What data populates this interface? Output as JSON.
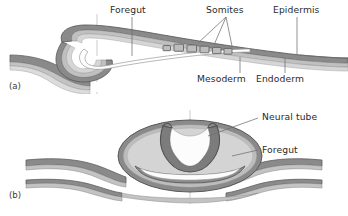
{
  "figure": {
    "panels": [
      {
        "id": "a",
        "id_label": "(a)",
        "view": "sagittal section",
        "labels": [
          {
            "key": "foregut",
            "text": "Foregut",
            "position": "top",
            "x": 110,
            "y": 6,
            "leader_from": [
              132,
              17
            ],
            "leader_to": [
              132,
              55
            ]
          },
          {
            "key": "somites",
            "text": "Somites",
            "position": "top",
            "x": 206,
            "y": 6,
            "leader_from": [
              225,
              17
            ],
            "leader_to": [
              196,
              43
            ]
          },
          {
            "key": "epidermis",
            "text": "Epidermis",
            "position": "top",
            "x": 275,
            "y": 6,
            "leader_from": [
              296,
              17
            ],
            "leader_to": [
              280,
              49
            ]
          },
          {
            "key": "mesoderm",
            "text": "Mesoderm",
            "position": "bottom",
            "x": 198,
            "y": 76,
            "leader_from": [
              240,
              74
            ],
            "leader_to": [
              240,
              56
            ]
          },
          {
            "key": "endoderm",
            "text": "Endoderm",
            "position": "bottom",
            "x": 262,
            "y": 76,
            "leader_from": [
              283,
              74
            ],
            "leader_to": [
              283,
              55
            ]
          }
        ],
        "somite_count": 6
      },
      {
        "id": "b",
        "id_label": "(b)",
        "view": "transverse section",
        "labels": [
          {
            "key": "neural-tube",
            "text": "Neural tube",
            "position": "right",
            "x": 262,
            "y": 113,
            "leader_from": [
              258,
              119
            ],
            "leader_to": [
              206,
              136
            ]
          },
          {
            "key": "foregut",
            "text": "Foregut",
            "position": "right",
            "x": 262,
            "y": 146,
            "leader_from": [
              258,
              151
            ],
            "leader_to": [
              222,
              157
            ]
          }
        ]
      }
    ],
    "guides": [
      {
        "key": "guide-a",
        "x": 97,
        "y1": 14,
        "y2": 94
      },
      {
        "key": "guide-b",
        "x": 190,
        "y1": 112,
        "y2": 208
      }
    ],
    "colors": {
      "outer_dark": "#7e7e7e",
      "outer_stroke": "#5e5e5e",
      "mid_gray": "#b9b9b9",
      "inner_light": "#d2d2d2",
      "lumen_white": "#fdfdfd",
      "label_text": "#2b2b2b",
      "leader_line": "#6f6f6f",
      "guide_line": "#c9c9c9",
      "background": "#ffffff"
    }
  }
}
